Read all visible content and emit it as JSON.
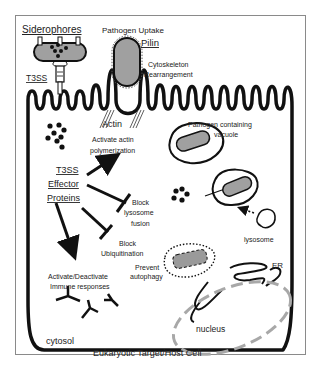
{
  "diagram": {
    "title": "Eukaryotic Target/Host Cell",
    "labels": {
      "siderophores": "Siderophores",
      "pathogen_uptake": "Pathogen Uptake",
      "pilin": "Pilin",
      "cytoskeleton_line1": "Cytoskeleton",
      "cytoskeleton_line2": "Rearrangement",
      "t3ss": "T3SS",
      "actin": "Actin",
      "activate_actin_line1": "Activate actin",
      "activate_actin_line2": "polymerization",
      "pcv_line1": "Pathogen containing",
      "pcv_line2": "vacuole",
      "effector_line1": "T3SS",
      "effector_line2": "Effector",
      "effector_line3": "Proteins",
      "block_lysosome_line1": "Block",
      "block_lysosome_line2": "lysosome",
      "block_lysosome_line3": "fusion",
      "block_ubiq_line1": "Block",
      "block_ubiq_line2": "Ubiquitination",
      "lysosome": "lysosome",
      "prevent_autophagy_line1": "Prevent",
      "prevent_autophagy_line2": "autophagy",
      "immune_line1": "Activate/Deactivate",
      "immune_line2": "Immune responses",
      "er": "ER",
      "nucleus": "nucleus",
      "cytosol": "cytosol"
    },
    "colors": {
      "membrane": "#111111",
      "pathogen_fill": "#a0a0a0",
      "nucleus_dash": "#a8a8a8",
      "frame": "#8a8a8a"
    }
  }
}
